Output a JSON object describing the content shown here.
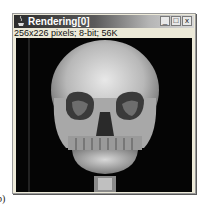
{
  "figure_label": "b)",
  "window": {
    "title": "Rendering[0]",
    "controls": {
      "minimize": "_",
      "maximize": "□",
      "close": "x"
    },
    "info_text": "256x226 pixels; 8-bit; 56K"
  },
  "canvas": {
    "content": "3D volume rendering of human skull (frontal view)",
    "background": "#050505"
  },
  "colors": {
    "titlebar_dark": "#2c2c2c",
    "titlebar_light": "#d8d8d8",
    "window_bg": "#ece9d8"
  }
}
